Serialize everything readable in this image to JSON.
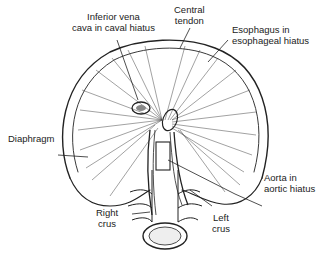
{
  "diagram": {
    "labels": {
      "ivc": {
        "line1": "Inferior vena",
        "line2": "cava in caval hiatus"
      },
      "central_tendon": {
        "line1": "Central",
        "line2": "tendon"
      },
      "esophagus": {
        "line1": "Esophagus in",
        "line2": "esophageal hiatus"
      },
      "diaphragm": {
        "line1": "Diaphragm"
      },
      "aorta": {
        "line1": "Aorta in",
        "line2": "aortic hiatus"
      },
      "right_crus": {
        "line1": "Right",
        "line2": "crus"
      },
      "left_crus": {
        "line1": "Left",
        "line2": "crus"
      }
    },
    "colors": {
      "ink": "#222222",
      "background": "#ffffff",
      "shade": "#9a9a9a"
    }
  }
}
